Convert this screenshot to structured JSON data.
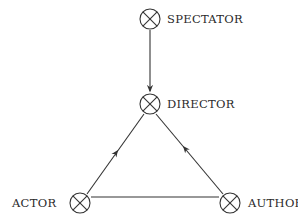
{
  "diagram": {
    "nodes": [
      {
        "id": "spectator",
        "label": "SPECTATOR",
        "symbol": "circled-x-icon"
      },
      {
        "id": "director",
        "label": "DIRECTOR",
        "symbol": "circled-x-icon"
      },
      {
        "id": "actor",
        "label": "ACTOR",
        "symbol": "circled-x-icon"
      },
      {
        "id": "author",
        "label": "AUTHOR",
        "symbol": "circled-x-icon"
      }
    ],
    "edges": [
      {
        "from": "spectator",
        "to": "director",
        "arrow": "end"
      },
      {
        "from": "actor",
        "to": "director",
        "arrow": "mid"
      },
      {
        "from": "author",
        "to": "director",
        "arrow": "mid"
      },
      {
        "from": "actor",
        "to": "author",
        "arrow": "none"
      }
    ],
    "colors": {
      "stroke": "#333333",
      "text": "#2a2a2a",
      "background": "#ffffff"
    }
  }
}
